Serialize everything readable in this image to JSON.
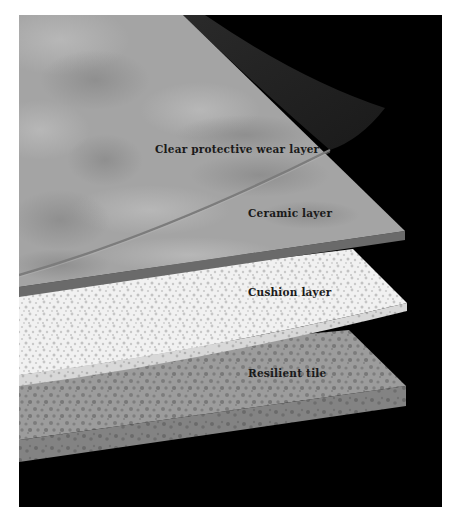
{
  "diagram": {
    "kind": "exploded flooring layers cross-section",
    "background_color": "#000000",
    "layers": [
      {
        "id": "wear",
        "label": "Clear protective wear layer",
        "color": "#a6a6a6"
      },
      {
        "id": "ceramic",
        "label": "Ceramic layer",
        "color": "#a3a3a3",
        "edge_color": "#6a6a6a"
      },
      {
        "id": "cushion",
        "label": "Cushion layer",
        "color": "#f2f2f2",
        "speckle_color": "#c4c4c4"
      },
      {
        "id": "tile",
        "label": "Resilient tile",
        "color": "#9c9c9c",
        "speckle_color": "#7a7a7a",
        "edge_color": "#828282"
      }
    ]
  }
}
